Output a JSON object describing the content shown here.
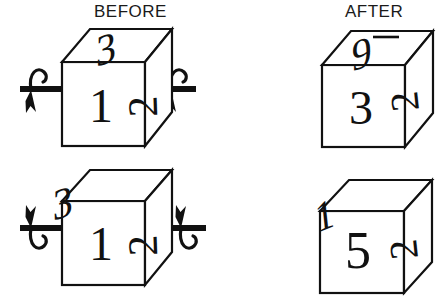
{
  "figure": {
    "type": "mental-rotation-cube-diagram",
    "background_color": "#ffffff",
    "stroke_color": "#111111",
    "headers": {
      "before": "BEFORE",
      "after": "AFTER"
    }
  },
  "rows": [
    {
      "id": "row-top",
      "before": {
        "cube_id": "before-cube-top",
        "faces": {
          "front": "1",
          "top": "3",
          "right": "2"
        },
        "axis": {
          "label": "horizontal-rotation-axis",
          "orientation": "horizontal",
          "rotation_direction": "clockwise-from-left",
          "arrow_left": "curl-over-top-pointing-down-left",
          "arrow_right": "curl-over-top-pointing-down-left"
        }
      },
      "after": {
        "cube_id": "after-cube-top",
        "faces": {
          "front": "3",
          "top": "9",
          "right": "2"
        },
        "top_face_has_underline_bar": true
      }
    },
    {
      "id": "row-bottom",
      "before": {
        "cube_id": "before-cube-bottom",
        "faces": {
          "front": "1",
          "top": "3",
          "right": "2"
        },
        "axis": {
          "label": "horizontal-rotation-axis",
          "orientation": "horizontal",
          "rotation_direction": "counter-clockwise-from-left",
          "arrow_left": "curl-under-bottom-pointing-up-left",
          "arrow_right": "curl-under-bottom-pointing-up-left"
        }
      },
      "after": {
        "cube_id": "after-cube-bottom",
        "faces": {
          "front": "5",
          "top": "1",
          "right": "2"
        },
        "top_face_has_underline_bar": false
      }
    }
  ]
}
